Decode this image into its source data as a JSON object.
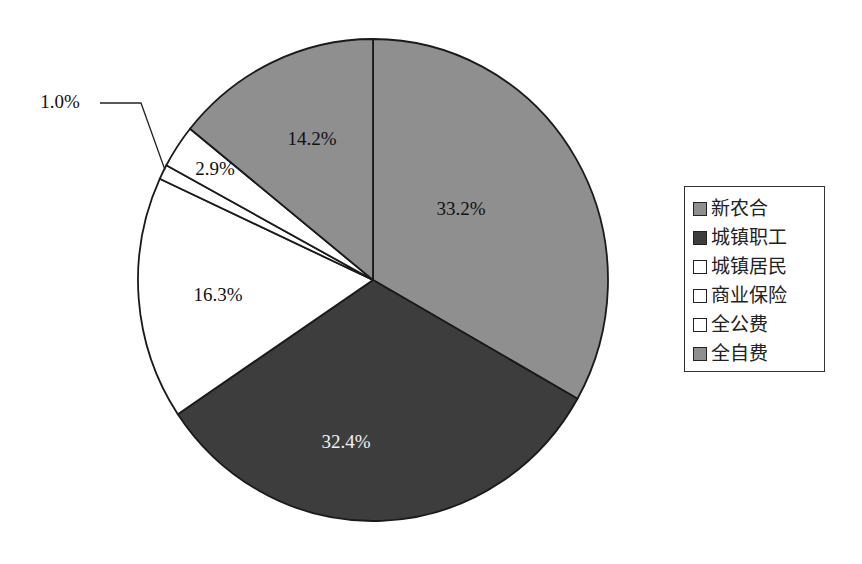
{
  "chart_data": {
    "type": "pie",
    "title": "",
    "start_angle": "12 o'clock",
    "direction": "clockwise",
    "categories": [
      "新农合",
      "城镇职工",
      "城镇居民",
      "商业保险",
      "全公费",
      "全自费"
    ],
    "values": [
      33.2,
      32.4,
      16.3,
      1.0,
      2.9,
      14.2
    ],
    "value_labels": [
      "33.2%",
      "32.4%",
      "16.3%",
      "1.0%",
      "2.9%",
      "14.2%"
    ],
    "colors": [
      "#8f8f8f",
      "#3d3d3d",
      "#ffffff",
      "#ffffff",
      "#ffffff",
      "#8f8f8f"
    ],
    "legend_position": "right",
    "annotations": [
      {
        "label": "1.0%",
        "type": "leader-line",
        "target": "商业保险"
      }
    ]
  },
  "legend": {
    "items": [
      {
        "label": "新农合",
        "color": "#8f8f8f"
      },
      {
        "label": "城镇职工",
        "color": "#3d3d3d"
      },
      {
        "label": "城镇居民",
        "color": "#ffffff"
      },
      {
        "label": "商业保险",
        "color": "#ffffff"
      },
      {
        "label": "全公费",
        "color": "#ffffff"
      },
      {
        "label": "全自费",
        "color": "#8f8f8f"
      }
    ]
  }
}
